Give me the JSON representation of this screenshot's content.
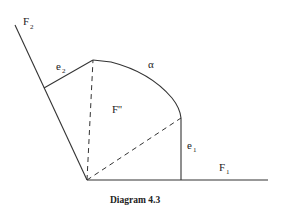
{
  "diagram": {
    "caption": "Diagram 4.3",
    "labels": {
      "f2": {
        "main": "F",
        "sub": "2"
      },
      "e2": {
        "main": "e",
        "sub": "2"
      },
      "alpha": "α",
      "f_double_prime": "F''",
      "e1": {
        "main": "e",
        "sub": "1"
      },
      "f1": {
        "main": "F",
        "sub": "1"
      }
    },
    "colors": {
      "line": "#333333",
      "background": "#ffffff"
    }
  }
}
